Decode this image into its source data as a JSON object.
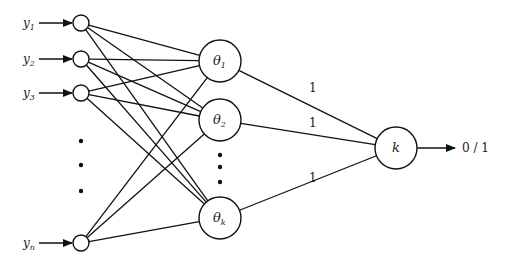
{
  "diagram": {
    "title": "",
    "inputs": [
      {
        "id": "y1",
        "label": "y",
        "sub": "1",
        "x": 81,
        "y": 23
      },
      {
        "id": "y2",
        "label": "y",
        "sub": "2",
        "x": 81,
        "y": 59
      },
      {
        "id": "y3",
        "label": "y",
        "sub": "3",
        "x": 81,
        "y": 93
      },
      {
        "id": "yn",
        "label": "y",
        "sub": "n",
        "x": 81,
        "y": 243
      }
    ],
    "input_ellipsis": [
      {
        "x": 81,
        "y": 141
      },
      {
        "x": 81,
        "y": 165
      },
      {
        "x": 81,
        "y": 191
      }
    ],
    "hidden": [
      {
        "id": "theta1",
        "label": "θ",
        "sub": "1",
        "x": 220,
        "y": 61
      },
      {
        "id": "theta2",
        "label": "θ",
        "sub": "2",
        "x": 220,
        "y": 120
      },
      {
        "id": "thetak",
        "label": "θ",
        "sub": "k",
        "x": 220,
        "y": 218
      }
    ],
    "hidden_ellipsis": [
      {
        "x": 220,
        "y": 155
      },
      {
        "x": 220,
        "y": 167
      },
      {
        "x": 220,
        "y": 182
      }
    ],
    "output_node": {
      "id": "k",
      "label": "k",
      "x": 396,
      "y": 148
    },
    "weights": [
      {
        "from": "theta1",
        "label": "1",
        "x": 309,
        "y": 92
      },
      {
        "from": "theta2",
        "label": "1",
        "x": 309,
        "y": 127
      },
      {
        "from": "thetak",
        "label": "1",
        "x": 309,
        "y": 182
      }
    ],
    "output_label": "0 / 1",
    "input_node_radius": 8,
    "hidden_node_radius": 21,
    "output_node_radius": 21
  }
}
